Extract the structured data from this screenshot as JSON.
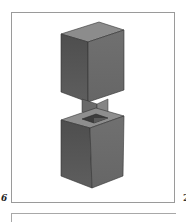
{
  "figure": {
    "number_label": "6",
    "next_figure_label": "2",
    "colors": {
      "frame": "#9a9a9a",
      "block_left_face": "#5a5a5a",
      "block_right_face": "#6e6e6e",
      "block_top_face": "#8a8a8a",
      "tenon_face": "#7a7a7a",
      "mortise_hole": "#3a3a3a"
    }
  }
}
